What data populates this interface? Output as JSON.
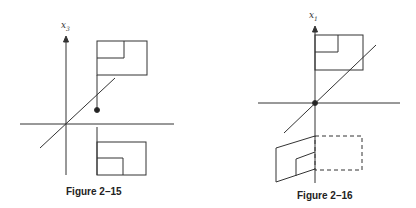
{
  "figures": [
    {
      "caption": "Figure 2–15",
      "axis_label": "x",
      "axis_sub": "3"
    },
    {
      "caption": "Figure 2–16",
      "axis_label": "x",
      "axis_sub": "1"
    }
  ]
}
